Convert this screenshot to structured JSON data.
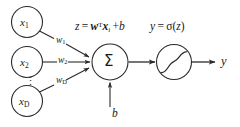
{
  "diagram": {
    "colors": {
      "stroke": "#2b2b2b",
      "text": "#1a1a1a",
      "background": "#ffffff"
    },
    "inputs": [
      {
        "name": "input-node-x1",
        "base": "x",
        "subscript": "1"
      },
      {
        "name": "input-node-x2",
        "base": "x",
        "subscript": "2"
      },
      {
        "name": "input-node-xD",
        "base": "x",
        "subscript": "D"
      }
    ],
    "ellipsis": "⋮",
    "weights": [
      {
        "name": "weight-label-w1",
        "base": "w",
        "subscript": "1"
      },
      {
        "name": "weight-label-w2",
        "base": "w",
        "subscript": "2"
      },
      {
        "name": "weight-label-wD",
        "base": "w",
        "subscript": "D"
      }
    ],
    "sum_node": {
      "label": "Σ"
    },
    "bias": {
      "label": "b"
    },
    "pre_activation_formula": {
      "lhs": "z",
      "equals": "=",
      "weight_vector": "w",
      "transpose": "T",
      "input_vector": "x",
      "input_subscript": "i",
      "plus": "+",
      "bias": "b",
      "full_text": "z = wᵀxᵢ + b"
    },
    "activation_formula": {
      "lhs": "y",
      "equals": "=",
      "function": "σ",
      "open_paren": "(",
      "argument": "z",
      "close_paren": ")",
      "full_text": "y = σ(z)"
    },
    "activation_node": {
      "shape": "sigmoid-curve"
    },
    "output": {
      "label": "y"
    }
  }
}
